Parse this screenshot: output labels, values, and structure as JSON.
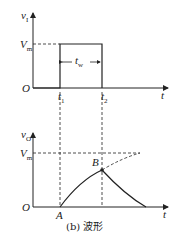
{
  "top_plot": {
    "y_axis_label": "v",
    "y_axis_sub": "I",
    "x_axis_label": "t",
    "origin_label": "O",
    "level_label": "V",
    "level_sub": "m",
    "t1_label": "t",
    "t1_sub": "1",
    "t2_label": "t",
    "t2_sub": "2",
    "width_label": "t",
    "width_sub": "w"
  },
  "bottom_plot": {
    "y_axis_label": "v",
    "y_axis_sub": "O",
    "x_axis_label": "t",
    "origin_label": "O",
    "level_label": "V",
    "level_sub": "m",
    "point_a": "A",
    "point_b": "B"
  },
  "caption": "(b) 波形",
  "colors": {
    "stroke": "#222222",
    "background": "#ffffff"
  }
}
